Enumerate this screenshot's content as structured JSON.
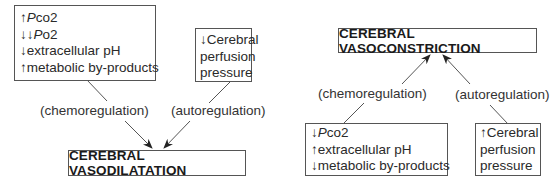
{
  "left_diagram": {
    "stimuli_box": {
      "lines": [
        {
          "arrow": "↑",
          "symbol": "P",
          "text": "co2"
        },
        {
          "arrow": "↓↓",
          "symbol": "P",
          "text": "o2"
        },
        {
          "arrow": "↓",
          "text": "extracellular pH"
        },
        {
          "arrow": "↑",
          "text": "metabolic by-products"
        }
      ]
    },
    "perfusion_box": {
      "lines": [
        "↓Cerebral",
        "perfusion",
        "pressure"
      ]
    },
    "chemo_label": "(chemoregulation)",
    "auto_label": "(autoregulation)",
    "outcome": "CEREBRAL VASODILATATION"
  },
  "right_diagram": {
    "outcome": "CEREBRAL VASOCONSTRICTION",
    "chemo_label": "(chemoregulation)",
    "auto_label": "(autoregulation)",
    "stimuli_box": {
      "lines": [
        {
          "arrow": "↓",
          "symbol": "P",
          "text": "co2"
        },
        {
          "arrow": "↑",
          "text": "extracellular pH"
        },
        {
          "arrow": "↓",
          "text": "metabolic by-products"
        }
      ]
    },
    "perfusion_box": {
      "lines": [
        "↑Cerebral",
        "perfusion",
        "pressure"
      ]
    }
  },
  "colors": {
    "line": "#555555",
    "text": "#222222",
    "background": "#ffffff"
  }
}
